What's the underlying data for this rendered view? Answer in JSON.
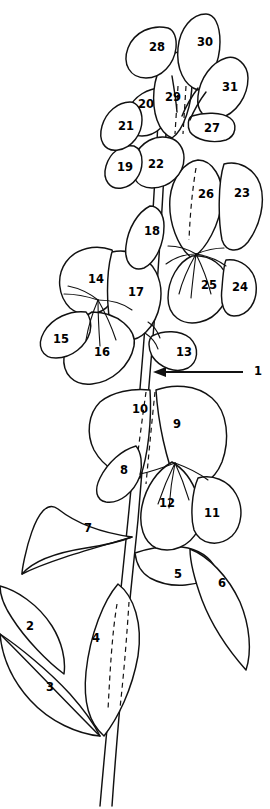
{
  "figure": {
    "background_color": "#ffffff",
    "line_color": "#111111",
    "width": 270,
    "height": 809,
    "total_labels": 31,
    "label_style": "bold numerals"
  },
  "callout": {
    "label": "1",
    "target": "main stem",
    "arrow_direction": "right-to-left",
    "arrow_tail_x": 243,
    "arrow_tail_y": 372,
    "arrow_tip_x": 156,
    "arrow_tip_y": 372,
    "label_x": 258,
    "label_y": 371
  },
  "labels": [
    {
      "n": "1",
      "x": 258,
      "y": 371,
      "part": "main-stem",
      "callout": true
    },
    {
      "n": "2",
      "x": 30,
      "y": 626,
      "part": "lower-left-leaflet",
      "callout": false
    },
    {
      "n": "3",
      "x": 50,
      "y": 687,
      "part": "lower-left-leaf",
      "callout": false
    },
    {
      "n": "4",
      "x": 96,
      "y": 638,
      "part": "lower-center-leaf",
      "callout": false
    },
    {
      "n": "5",
      "x": 178,
      "y": 574,
      "part": "right-leaflet-lower",
      "callout": false
    },
    {
      "n": "6",
      "x": 222,
      "y": 583,
      "part": "right-leaf-lower",
      "callout": false
    },
    {
      "n": "7",
      "x": 88,
      "y": 528,
      "part": "left-leaf-mid",
      "callout": false
    },
    {
      "n": "8",
      "x": 124,
      "y": 470,
      "part": "stipule-left",
      "callout": false
    },
    {
      "n": "9",
      "x": 177,
      "y": 424,
      "part": "wing-petal-right",
      "callout": false
    },
    {
      "n": "10",
      "x": 140,
      "y": 409,
      "part": "standard-petal-left",
      "callout": false
    },
    {
      "n": "11",
      "x": 212,
      "y": 513,
      "part": "wing-petal-outer",
      "callout": false
    },
    {
      "n": "12",
      "x": 167,
      "y": 503,
      "part": "keel-petal",
      "callout": false
    },
    {
      "n": "13",
      "x": 184,
      "y": 352,
      "part": "bract-right",
      "callout": false
    },
    {
      "n": "14",
      "x": 96,
      "y": 279,
      "part": "standard-petal",
      "callout": false
    },
    {
      "n": "15",
      "x": 61,
      "y": 339,
      "part": "wing-petal-lower",
      "callout": false
    },
    {
      "n": "16",
      "x": 102,
      "y": 352,
      "part": "keel-petal-left",
      "callout": false
    },
    {
      "n": "17",
      "x": 136,
      "y": 292,
      "part": "wing-petal-left",
      "callout": false
    },
    {
      "n": "18",
      "x": 152,
      "y": 231,
      "part": "bract-left",
      "callout": false
    },
    {
      "n": "19",
      "x": 125,
      "y": 167,
      "part": "sepal-left",
      "callout": false
    },
    {
      "n": "20",
      "x": 146,
      "y": 104,
      "part": "upper-bud-left",
      "callout": false
    },
    {
      "n": "21",
      "x": 126,
      "y": 126,
      "part": "upper-bud-outer",
      "callout": false
    },
    {
      "n": "22",
      "x": 156,
      "y": 164,
      "part": "upper-petal",
      "callout": false
    },
    {
      "n": "23",
      "x": 242,
      "y": 193,
      "part": "wing-petal-right-up",
      "callout": false
    },
    {
      "n": "24",
      "x": 240,
      "y": 287,
      "part": "keel-petal-right",
      "callout": false
    },
    {
      "n": "25",
      "x": 209,
      "y": 285,
      "part": "keel-petal-center",
      "callout": false
    },
    {
      "n": "26",
      "x": 206,
      "y": 194,
      "part": "standard-petal-upper",
      "callout": false
    },
    {
      "n": "27",
      "x": 212,
      "y": 128,
      "part": "small-bract",
      "callout": false
    },
    {
      "n": "28",
      "x": 157,
      "y": 47,
      "part": "apex-bud-left",
      "callout": false
    },
    {
      "n": "29",
      "x": 173,
      "y": 97,
      "part": "apex-petal",
      "callout": false
    },
    {
      "n": "30",
      "x": 205,
      "y": 42,
      "part": "apex-bud-top",
      "callout": false
    },
    {
      "n": "31",
      "x": 230,
      "y": 87,
      "part": "apex-bud-right",
      "callout": false
    }
  ]
}
